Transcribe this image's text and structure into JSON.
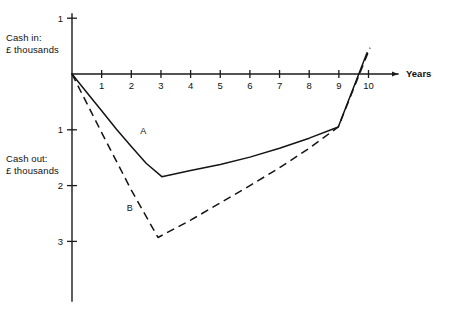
{
  "chart_data": {
    "type": "line",
    "title": "",
    "subtitle": "",
    "xlabel": "Years",
    "ylabel_positive": "Cash in:\n£ thousands",
    "ylabel_negative": "Cash out:\n£ thousands",
    "x_tick_labels": [
      "1",
      "2",
      "3",
      "4",
      "5",
      "6",
      "7",
      "8",
      "9",
      "10"
    ],
    "x_tick_values": [
      1,
      2,
      3,
      4,
      5,
      6,
      7,
      8,
      9,
      10
    ],
    "y_tick_labels_above": [
      "1"
    ],
    "y_tick_values_above": [
      1
    ],
    "y_tick_labels_below": [
      "1",
      "2",
      "3"
    ],
    "y_tick_values_below": [
      -1,
      -2,
      -3
    ],
    "xlim": [
      0,
      11.05
    ],
    "ylim": [
      -4.05,
      1.4
    ],
    "grid": false,
    "legend": "inline-labels",
    "axis_arrow": "x-axis-right",
    "series": [
      {
        "name": "A",
        "style": "solid",
        "label": "A",
        "label_x": 2.4,
        "label_y": -1.07,
        "x": [
          0,
          0.5,
          1.0,
          1.5,
          2.0,
          2.5,
          3.03,
          4.0,
          5.0,
          6.0,
          7.0,
          8.0,
          8.98,
          9.95
        ],
        "values": [
          0,
          -0.33,
          -0.66,
          -0.99,
          -1.3,
          -1.6,
          -1.84,
          -1.73,
          -1.62,
          -1.49,
          -1.33,
          -1.15,
          -0.95,
          0.38
        ]
      },
      {
        "name": "B",
        "style": "dashed",
        "label": "B",
        "label_x": 1.95,
        "label_y": -2.46,
        "x": [
          0,
          1.0,
          2.0,
          2.9,
          4.0,
          5.0,
          6.0,
          7.0,
          8.0,
          8.98,
          10.05
        ],
        "values": [
          0,
          -1.05,
          -2.08,
          -2.93,
          -2.62,
          -2.31,
          -2.0,
          -1.68,
          -1.33,
          -0.95,
          0.47
        ]
      }
    ]
  }
}
